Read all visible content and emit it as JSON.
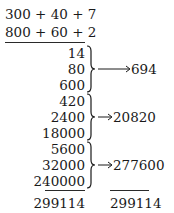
{
  "problem": {
    "multiplicand": "300 + 40 + 7",
    "multiplier": "800 + 60 + 2"
  },
  "partial_products": {
    "group1": {
      "items": [
        "14",
        "80",
        "600"
      ],
      "sum": "694"
    },
    "group2": {
      "items": [
        "420",
        "2400",
        "18000"
      ],
      "sum": "20820"
    },
    "group3": {
      "items": [
        "5600",
        "32000",
        "240000"
      ],
      "sum": "277600"
    }
  },
  "totals": {
    "left_total": "299114",
    "right_total": "299114"
  },
  "colors": {
    "ink": "#1a1a1a",
    "background": "#ffffff"
  }
}
